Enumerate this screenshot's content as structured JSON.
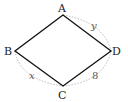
{
  "diagram": {
    "type": "quadrilateral",
    "vertices": [
      {
        "label": "A",
        "x": 63,
        "y": 15
      },
      {
        "label": "B",
        "x": 15,
        "y": 51
      },
      {
        "label": "C",
        "x": 63,
        "y": 86
      },
      {
        "label": "D",
        "x": 111,
        "y": 51
      }
    ],
    "arc_labels": {
      "AD": "y",
      "BC": "x",
      "CD": "8"
    },
    "colors": {
      "edge": "#111111",
      "arc": "#aaaaaa"
    }
  }
}
